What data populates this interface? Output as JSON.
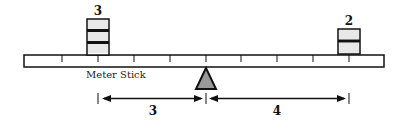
{
  "diagram": {
    "left_weight": {
      "count_label": "3",
      "blocks": 3
    },
    "right_weight": {
      "count_label": "2",
      "blocks": 2
    },
    "stick_label": "Meter Stick",
    "left_distance": "3",
    "right_distance": "4",
    "colors": {
      "line": "#111111",
      "fulcrum": "#999999",
      "background": "#ffffff"
    }
  }
}
